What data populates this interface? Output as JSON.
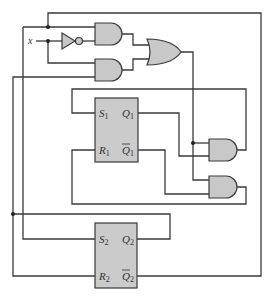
{
  "diagram": {
    "type": "sequential-logic-circuit",
    "input": {
      "label": "x"
    },
    "colors": {
      "wire": "#3a3a3a",
      "gate_fill": "#c8c8c8",
      "ff_fill": "#cbcbcb"
    },
    "gates": [
      {
        "id": "not1",
        "type": "NOT"
      },
      {
        "id": "and1",
        "type": "AND"
      },
      {
        "id": "and2",
        "type": "AND"
      },
      {
        "id": "or1",
        "type": "OR"
      },
      {
        "id": "and3",
        "type": "AND"
      },
      {
        "id": "and4",
        "type": "AND"
      }
    ],
    "flipflops": [
      {
        "id": "ff1",
        "type": "SR",
        "inputs": {
          "s": {
            "letter": "S",
            "sub": "1"
          },
          "r": {
            "letter": "R",
            "sub": "1"
          }
        },
        "outputs": {
          "q": {
            "letter": "Q",
            "sub": "1"
          },
          "qbar": {
            "letter": "Q",
            "sub": "1"
          }
        }
      },
      {
        "id": "ff2",
        "type": "SR",
        "inputs": {
          "s": {
            "letter": "S",
            "sub": "2"
          },
          "r": {
            "letter": "R",
            "sub": "2"
          }
        },
        "outputs": {
          "q": {
            "letter": "Q",
            "sub": "2"
          },
          "qbar": {
            "letter": "Q",
            "sub": "2"
          }
        }
      }
    ]
  }
}
